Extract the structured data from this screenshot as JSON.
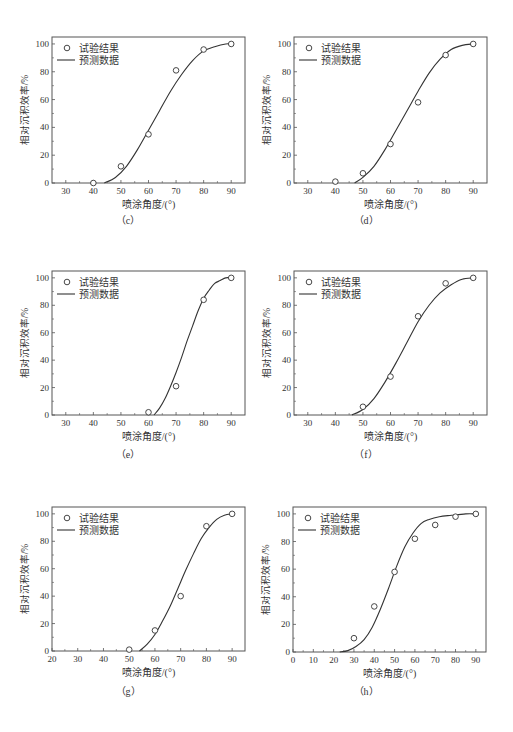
{
  "common": {
    "xlabel": "喷涂角度/(°)",
    "ylabel": "相对沉积效率/%",
    "legend_points": "试验结果",
    "legend_line": "预测数据",
    "colors": {
      "axis": "#555555",
      "curve": "#333333",
      "marker": "#333333"
    }
  },
  "chart_data": [
    {
      "id": "c",
      "caption": "（c）",
      "type": "scatter+line",
      "title": "",
      "xlabel": "喷涂角度/(°)",
      "ylabel": "相对沉积效率/%",
      "xlim": [
        25,
        95
      ],
      "ylim": [
        0,
        105
      ],
      "xticks": [
        30,
        40,
        50,
        60,
        70,
        80,
        90
      ],
      "yticks": [
        0,
        20,
        40,
        60,
        80,
        100
      ],
      "legend": [
        "试验结果",
        "预测数据"
      ],
      "legend_position": "upper left",
      "series": [
        {
          "name": "试验结果",
          "type": "scatter",
          "x": [
            40,
            50,
            60,
            70,
            80,
            90
          ],
          "y": [
            0,
            12,
            35,
            81,
            96,
            100
          ]
        },
        {
          "name": "预测数据",
          "type": "line",
          "x": [
            44,
            48,
            52,
            56,
            60,
            64,
            68,
            72,
            76,
            80,
            84,
            88,
            90
          ],
          "y": [
            0,
            4,
            12,
            24,
            38,
            52,
            66,
            78,
            88,
            95,
            98,
            100,
            100
          ]
        }
      ]
    },
    {
      "id": "d",
      "caption": "（d）",
      "type": "scatter+line",
      "title": "",
      "xlabel": "喷涂角度/(°)",
      "ylabel": "相对沉积效率/%",
      "xlim": [
        25,
        95
      ],
      "ylim": [
        0,
        105
      ],
      "xticks": [
        30,
        40,
        50,
        60,
        70,
        80,
        90
      ],
      "yticks": [
        0,
        20,
        40,
        60,
        80,
        100
      ],
      "legend": [
        "试验结果",
        "预测数据"
      ],
      "legend_position": "upper left",
      "series": [
        {
          "name": "试验结果",
          "type": "scatter",
          "x": [
            40,
            50,
            60,
            70,
            80,
            90
          ],
          "y": [
            1,
            7,
            28,
            58,
            92,
            100
          ]
        },
        {
          "name": "预测数据",
          "type": "line",
          "x": [
            47,
            50,
            54,
            58,
            62,
            66,
            70,
            74,
            78,
            82,
            86,
            90
          ],
          "y": [
            0,
            4,
            12,
            24,
            38,
            52,
            66,
            79,
            89,
            96,
            99,
            100
          ]
        }
      ]
    },
    {
      "id": "e",
      "caption": "（e）",
      "type": "scatter+line",
      "title": "",
      "xlabel": "喷涂角度/(°)",
      "ylabel": "相对沉积效率/%",
      "xlim": [
        25,
        95
      ],
      "ylim": [
        0,
        105
      ],
      "xticks": [
        30,
        40,
        50,
        60,
        70,
        80,
        90
      ],
      "yticks": [
        0,
        20,
        40,
        60,
        80,
        100
      ],
      "legend": [
        "试验结果",
        "预测数据"
      ],
      "legend_position": "upper left",
      "series": [
        {
          "name": "试验结果",
          "type": "scatter",
          "x": [
            60,
            70,
            80,
            90
          ],
          "y": [
            2,
            21,
            84,
            100
          ]
        },
        {
          "name": "预测数据",
          "type": "line",
          "x": [
            62,
            64,
            66,
            68,
            70,
            72,
            74,
            76,
            78,
            80,
            82,
            84,
            86,
            88,
            90
          ],
          "y": [
            0,
            5,
            12,
            21,
            31,
            42,
            54,
            65,
            76,
            85,
            91,
            96,
            98,
            100,
            100
          ]
        }
      ]
    },
    {
      "id": "f",
      "caption": "（f）",
      "type": "scatter+line",
      "title": "",
      "xlabel": "喷涂角度/(°)",
      "ylabel": "相对沉积效率/%",
      "xlim": [
        25,
        95
      ],
      "ylim": [
        0,
        105
      ],
      "xticks": [
        30,
        40,
        50,
        60,
        70,
        80,
        90
      ],
      "yticks": [
        0,
        20,
        40,
        60,
        80,
        100
      ],
      "legend": [
        "试验结果",
        "预测数据"
      ],
      "legend_position": "upper left",
      "series": [
        {
          "name": "试验结果",
          "type": "scatter",
          "x": [
            50,
            60,
            70,
            80,
            90
          ],
          "y": [
            6,
            28,
            72,
            96,
            100
          ]
        },
        {
          "name": "预测数据",
          "type": "line",
          "x": [
            46,
            50,
            54,
            58,
            62,
            66,
            70,
            74,
            78,
            82,
            86,
            90
          ],
          "y": [
            0,
            4,
            12,
            24,
            38,
            53,
            68,
            80,
            89,
            95,
            99,
            100
          ]
        }
      ]
    },
    {
      "id": "g",
      "caption": "（g）",
      "type": "scatter+line",
      "title": "",
      "xlabel": "喷涂角度/(°)",
      "ylabel": "相对沉积效率/%",
      "xlim": [
        20,
        95
      ],
      "ylim": [
        0,
        105
      ],
      "xticks": [
        20,
        30,
        40,
        50,
        60,
        70,
        80,
        90
      ],
      "yticks": [
        0,
        20,
        40,
        60,
        80,
        100
      ],
      "legend": [
        "试验结果",
        "预测数据"
      ],
      "legend_position": "upper left",
      "series": [
        {
          "name": "试验结果",
          "type": "scatter",
          "x": [
            50,
            60,
            70,
            80,
            90
          ],
          "y": [
            1,
            15,
            40,
            91,
            100
          ]
        },
        {
          "name": "预测数据",
          "type": "line",
          "x": [
            54,
            57,
            60,
            63,
            66,
            69,
            72,
            75,
            78,
            81,
            84,
            87,
            90
          ],
          "y": [
            0,
            5,
            12,
            22,
            33,
            46,
            59,
            71,
            82,
            90,
            96,
            99,
            100
          ]
        }
      ]
    },
    {
      "id": "h",
      "caption": "（h）",
      "type": "scatter+line",
      "title": "",
      "xlabel": "喷涂角度/(°)",
      "ylabel": "相对沉积效率/%",
      "xlim": [
        0,
        95
      ],
      "ylim": [
        0,
        105
      ],
      "xticks": [
        0,
        10,
        20,
        30,
        40,
        50,
        60,
        70,
        80,
        90
      ],
      "yticks": [
        0,
        20,
        40,
        60,
        80,
        100
      ],
      "legend": [
        "试验结果",
        "预测数据"
      ],
      "legend_position": "upper left",
      "series": [
        {
          "name": "试验结果",
          "type": "scatter",
          "x": [
            30,
            40,
            50,
            60,
            70,
            80,
            90
          ],
          "y": [
            10,
            33,
            58,
            82,
            92,
            98,
            100
          ]
        },
        {
          "name": "预测数据",
          "type": "line",
          "x": [
            23,
            27,
            31,
            35,
            39,
            43,
            47,
            51,
            55,
            59,
            63,
            67,
            72,
            78,
            85,
            90
          ],
          "y": [
            0,
            1,
            4,
            9,
            18,
            31,
            46,
            62,
            76,
            86,
            93,
            96,
            98,
            99,
            100,
            100
          ]
        }
      ]
    }
  ]
}
